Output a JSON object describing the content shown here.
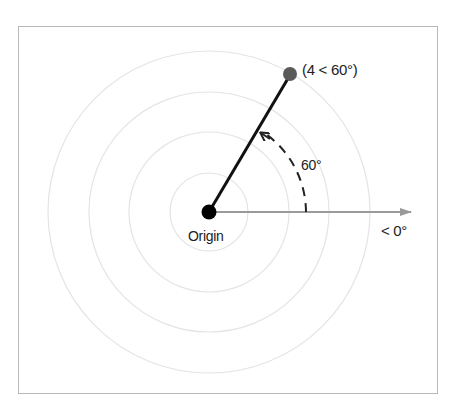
{
  "diagram": {
    "type": "polar-coordinate",
    "origin_label": "Origin",
    "point_label": "(4 < 60°)",
    "angle_label": "60°",
    "axis_label": "< 0°",
    "point": {
      "r": 4,
      "theta_deg": 60
    },
    "rings": [
      1,
      2,
      3,
      4
    ],
    "colors": {
      "rings": "#e4e4e4",
      "vector": "#111111",
      "axis": "#999999",
      "point": "#555555",
      "origin": "#000000",
      "frame": "#b8b8b8"
    }
  }
}
